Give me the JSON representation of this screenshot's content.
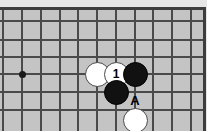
{
  "diagram": {
    "type": "go-board-diagram",
    "colors": {
      "board_background": "#c4c4c4",
      "margin_background": "#e6e6e6",
      "grid_line": "#4a4a4a",
      "border_edge": "#3d3d3d",
      "black_stone": "#111111",
      "white_stone": "#ffffff",
      "page_background": "#ffffff"
    },
    "board": {
      "grid": {
        "vertical_line_x": [
          3,
          22,
          41,
          60,
          78,
          97,
          116,
          135,
          153,
          172,
          191
        ],
        "horizontal_line_y": [
          11,
          30,
          47,
          64,
          82,
          100
        ],
        "spacing": 18.7,
        "grid_visible": true
      },
      "star_points": [
        {
          "name": "star-point-left",
          "x": 22,
          "y": 64
        }
      ]
    },
    "stones": [
      {
        "name": "white-stone-left",
        "color": "white",
        "label": "",
        "x": 97,
        "y": 64
      },
      {
        "name": "white-stone-move-1",
        "color": "white",
        "label": "1",
        "x": 116,
        "y": 64
      },
      {
        "name": "black-stone-upper-right",
        "color": "black",
        "label": "",
        "x": 135,
        "y": 64
      },
      {
        "name": "black-stone-lower",
        "color": "black",
        "label": "",
        "x": 116,
        "y": 82
      },
      {
        "name": "white-stone-bottom",
        "color": "white",
        "label": "",
        "x": 135,
        "y": 110
      }
    ],
    "labels": [
      {
        "name": "point-label-a",
        "text": "A",
        "x": 135,
        "y": 90
      }
    ]
  }
}
